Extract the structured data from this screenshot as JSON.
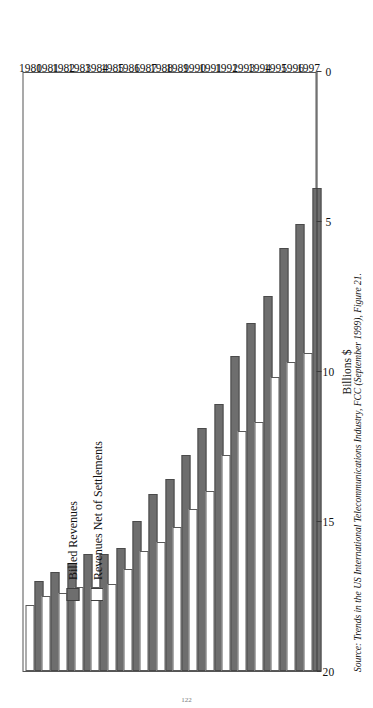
{
  "figure": {
    "legend": {
      "position": "top-left-inside-plot",
      "items": [
        {
          "label": "Billed Revenues",
          "swatch": "filled-gray-swatch",
          "color": "#6e6e6e"
        },
        {
          "label": "Revenues Net of Settlements",
          "swatch": "outlined-white-swatch",
          "color": "#ffffff"
        }
      ]
    },
    "source": {
      "word": "Source:",
      "text": "Trends in the US International Telecommunications Industry, FCC (September 1999), Figure 21."
    },
    "page_number": "122"
  },
  "chart_data": {
    "type": "bar",
    "orientation": "horizontal-rotated",
    "title": "",
    "subtitle": "",
    "xlabel": "",
    "ylabel": "Billions $",
    "value_axis_title": "Billions $",
    "ylim": [
      0,
      20
    ],
    "value_ticks": [
      0,
      5,
      10,
      15,
      20
    ],
    "value_tick_labels": [
      "0",
      "5",
      "10",
      "15",
      "20"
    ],
    "grid": false,
    "legend_position": "top-left",
    "categories": [
      "1980",
      "1981",
      "1982",
      "1983",
      "1984",
      "1985",
      "1986",
      "1987",
      "1988",
      "1989",
      "1990",
      "1991",
      "1992",
      "1993",
      "1994",
      "1995",
      "1996",
      "1997"
    ],
    "series": [
      {
        "name": "Billed Revenues",
        "color": "#6e6e6e",
        "values": [
          3.0,
          3.3,
          3.6,
          3.9,
          3.9,
          4.1,
          5.0,
          5.9,
          6.4,
          7.2,
          8.1,
          8.9,
          10.5,
          11.6,
          12.5,
          14.1,
          14.9,
          16.1
        ]
      },
      {
        "name": "Revenues Net of Settlements",
        "color": "#ffffff",
        "values": [
          2.2,
          2.5,
          2.6,
          2.8,
          2.8,
          2.9,
          3.4,
          4.0,
          4.3,
          4.8,
          5.4,
          6.0,
          7.2,
          8.0,
          8.3,
          9.8,
          10.3,
          10.6
        ]
      }
    ]
  }
}
